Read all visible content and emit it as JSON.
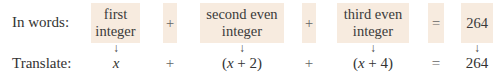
{
  "rows": {
    "words_label": "In words:",
    "translate_label": "Translate:"
  },
  "words": {
    "first_line1": "first",
    "first_line2": "integer",
    "plus1": "+",
    "second_line1": "second even",
    "second_line2": "integer",
    "plus2": "+",
    "third_line1": "third even",
    "third_line2": "integer",
    "equals": "=",
    "result": "264"
  },
  "translate": {
    "first": "x",
    "plus1": "+",
    "second": "(x + 2)",
    "plus2": "+",
    "third": "(x + 4)",
    "equals": "=",
    "result": "264"
  },
  "arrow_glyph": "↓",
  "colors": {
    "box_background": "#f7ebdf"
  }
}
